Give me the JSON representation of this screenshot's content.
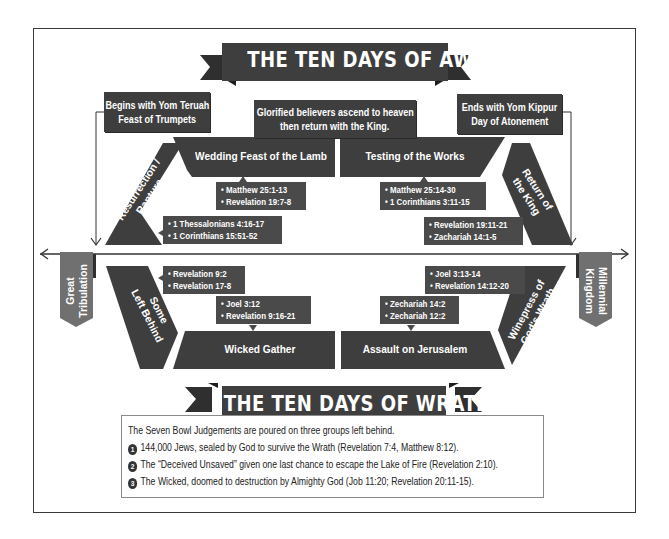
{
  "title_top": "THE TEN DAYS OF AWE",
  "title_bottom": "THE TEN DAYS OF WRATH",
  "top_boxes": {
    "left": [
      "Begins with Yom Teruah",
      "Feast of Trumpets"
    ],
    "center": [
      "Glorified believers ascend to heaven",
      "then return with the King."
    ],
    "right": [
      "Ends with Yom Kippur",
      "Day of Atonement"
    ]
  },
  "upper_stages": {
    "resurrection": [
      "Resurrection /",
      "Rapture"
    ],
    "wedding": "Wedding Feast of the Lamb",
    "testing": "Testing of the Works",
    "return": [
      "Return of",
      "the King"
    ]
  },
  "lower_stages": {
    "left_behind": [
      "Some",
      "Left Behind"
    ],
    "wicked_gather": "Wicked Gather",
    "assault": "Assault on Jerusalem",
    "winepress": [
      "Winepress of",
      "God's Wrath"
    ]
  },
  "side_tabs": {
    "left": [
      "Great",
      "Tribulation"
    ],
    "right": [
      "Millennial",
      "Kingdom"
    ]
  },
  "references": {
    "wedding": [
      "• Matthew 25:1-13",
      "• Revelation 19:7-8"
    ],
    "resurrection": [
      "• 1 Thessalonians 4:16-17",
      "• 1 Corinthians 15:51-52"
    ],
    "testing": [
      "• Matthew 25:14-30",
      "• 1 Corinthians 3:11-15"
    ],
    "return": [
      "• Revelation 19:11-21",
      "• Zachariah 14:1-5"
    ],
    "left_behind": [
      "• Revelation 9:2",
      "• Revelation 17-8"
    ],
    "wicked_gather": [
      "• Joel 3:12",
      "• Revelation 9:16-21"
    ],
    "winepress": [
      "• Joel 3:13-14",
      "• Revelation 14:12-20"
    ],
    "assault": [
      "• Zechariah 14:2",
      "• Zechariah 12:2"
    ]
  },
  "wrath": {
    "intro": "The Seven Bowl Judgements are poured on three groups left behind.",
    "items": [
      {
        "num": "1",
        "text": "144,000 Jews, sealed by God to survive the Wrath (Revelation 7:4, Matthew 8:12)."
      },
      {
        "num": "2",
        "text": "The “Deceived Unsaved” given one last chance to escape the Lake of Fire (Revelation 2:10)."
      },
      {
        "num": "3",
        "text": "The Wicked, doomed to destruction by Almighty God (Job 11:20; Revelation 20:11-15)."
      }
    ]
  },
  "colors": {
    "dark": "#3e3e3e",
    "tab": "#6e6e6e",
    "line": "#333333"
  }
}
